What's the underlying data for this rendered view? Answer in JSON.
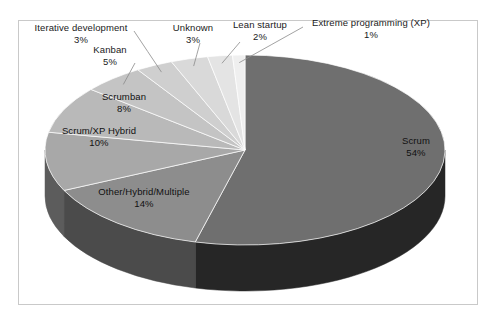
{
  "chart_data": {
    "type": "pie",
    "title": "",
    "subtitle": "",
    "xlabel": "",
    "ylabel": "",
    "legend_position": "none",
    "grid": false,
    "labels_show_percent": true,
    "total_percent": 100,
    "three_d": true,
    "categories": [
      "Scrum",
      "Other/Hybrid/Multiple",
      "Scrum/XP Hybrid",
      "Scrumban",
      "Kanban",
      "Iterative development",
      "Unknown",
      "Lean startup",
      "Extreme programming (XP)"
    ],
    "values": [
      54,
      14,
      10,
      8,
      5,
      3,
      3,
      2,
      1
    ],
    "slices": [
      {
        "name": "Scrum",
        "percent": 54,
        "percent_label": "54%",
        "color": "#6f6f6f",
        "side_color": "#262626",
        "label_placement": "inside",
        "leader_line": false
      },
      {
        "name": "Other/Hybrid/Multiple",
        "percent": 14,
        "percent_label": "14%",
        "color": "#8d8d8d",
        "side_color": "#4b4b4b",
        "label_placement": "inside",
        "leader_line": false
      },
      {
        "name": "Scrum/XP Hybrid",
        "percent": 10,
        "percent_label": "10%",
        "color": "#a8a8a8",
        "side_color": "#5c5c5c",
        "label_placement": "inside",
        "leader_line": false
      },
      {
        "name": "Scrumban",
        "percent": 8,
        "percent_label": "8%",
        "color": "#b9b9b9",
        "side_color": "#6a6a6a",
        "label_placement": "inside",
        "leader_line": false
      },
      {
        "name": "Kanban",
        "percent": 5,
        "percent_label": "5%",
        "color": "#c4c4c4",
        "side_color": "#6f6f6f",
        "label_placement": "outside",
        "leader_line": true
      },
      {
        "name": "Iterative development",
        "percent": 3,
        "percent_label": "3%",
        "color": "#cfcfcf",
        "side_color": "#757575",
        "label_placement": "outside",
        "leader_line": true
      },
      {
        "name": "Unknown",
        "percent": 3,
        "percent_label": "3%",
        "color": "#d9d9d9",
        "side_color": "#7c7c7c",
        "label_placement": "outside",
        "leader_line": true
      },
      {
        "name": "Lean startup",
        "percent": 2,
        "percent_label": "2%",
        "color": "#e4e4e4",
        "side_color": "#848484",
        "label_placement": "outside",
        "leader_line": true
      },
      {
        "name": "Extreme programming (XP)",
        "percent": 1,
        "percent_label": "1%",
        "color": "#efefef",
        "side_color": "#8c8c8c",
        "label_placement": "outside",
        "leader_line": true
      }
    ]
  },
  "frame": {
    "border_color": "#c9c9c9",
    "background": "#ffffff"
  }
}
